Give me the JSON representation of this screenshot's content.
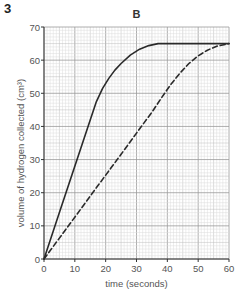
{
  "question_number": "3",
  "chart_data": {
    "type": "line",
    "title": "B",
    "xlabel": "time (seconds)",
    "ylabel": "volume of hydrogen collected (cm³)",
    "xlim": [
      0,
      60
    ],
    "ylim": [
      0,
      70
    ],
    "xticks": [
      0,
      10,
      20,
      30,
      40,
      50,
      60
    ],
    "yticks": [
      0,
      10,
      20,
      30,
      40,
      50,
      60,
      70
    ],
    "grid": true,
    "legend": null,
    "series": [
      {
        "name": "solid",
        "style": "solid",
        "color": "#2a2a2a",
        "x": [
          0,
          5,
          10,
          15,
          17,
          19,
          21,
          23,
          25,
          28,
          31,
          34,
          37,
          40,
          45,
          50,
          55,
          60
        ],
        "y": [
          0,
          14,
          28,
          42,
          47.5,
          51.5,
          54.5,
          57,
          59,
          61.5,
          63.3,
          64.4,
          65,
          65,
          65,
          65,
          65,
          65
        ]
      },
      {
        "name": "dashed",
        "style": "dashed",
        "color": "#2a2a2a",
        "x": [
          0,
          5,
          10,
          15,
          20,
          25,
          30,
          35,
          38,
          41,
          44,
          47,
          50,
          53,
          56,
          60
        ],
        "y": [
          0,
          6.3,
          12.6,
          19,
          25.3,
          31.6,
          38,
          44.3,
          48.5,
          52.5,
          56,
          59,
          61.3,
          63,
          64.2,
          65
        ]
      }
    ]
  }
}
